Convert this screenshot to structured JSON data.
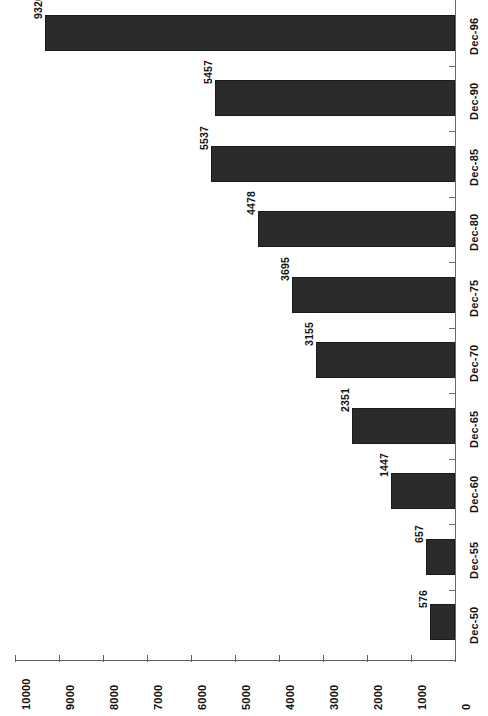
{
  "chart_data": {
    "type": "bar",
    "orientation": "horizontal",
    "rotated_page": true,
    "title": "",
    "subtitle": "",
    "xlabel": "",
    "ylabel": "",
    "grid": false,
    "legend": null,
    "categories": [
      "Dec-50",
      "Dec-55",
      "Dec-60",
      "Dec-65",
      "Dec-70",
      "Dec-75",
      "Dec-80",
      "Dec-85",
      "Dec-90",
      "Dec-96"
    ],
    "values": [
      576,
      657,
      1447,
      2351,
      3155,
      3695,
      4478,
      5537,
      5457,
      9326
    ],
    "value_labels": [
      "576",
      "657",
      "1447",
      "2351",
      "3155",
      "3695",
      "4478",
      "5537",
      "5457",
      "9326"
    ],
    "xlim": [
      0,
      10000
    ],
    "axis_ticks": [
      10000,
      9000,
      8000,
      7000,
      6000,
      5000,
      4000,
      3000,
      2000,
      1000,
      0
    ],
    "axis_tick_labels": [
      "10000",
      "9000",
      "8000",
      "7000",
      "6000",
      "5000",
      "4000",
      "3000",
      "2000",
      "1000",
      "0"
    ],
    "bar_color": "#2b2b2b",
    "bar_edge_color": "#1a1a1a",
    "axis_color": "#5d5d5d",
    "text_color": "#111111",
    "background_color": "#ffffff"
  }
}
